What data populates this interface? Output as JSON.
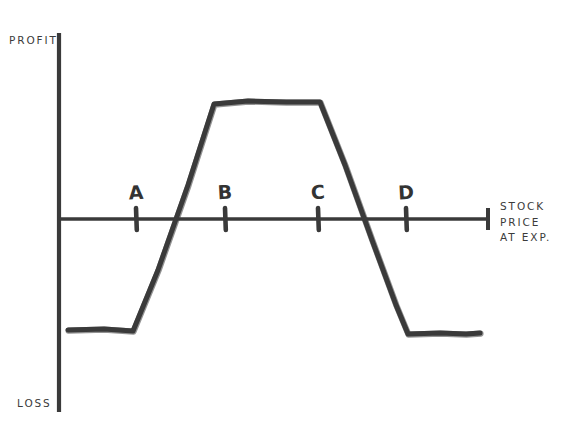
{
  "figure": {
    "kind": "options-payoff-diagram",
    "background_color": "#ffffff",
    "ink_color": "#3a3a3a",
    "text_color": "#3b3b3b"
  },
  "axes": {
    "y_axis": {
      "top_label": "PROFIT",
      "bottom_label": "LOSS",
      "x_pixel": 59,
      "y_top_pixel": 33,
      "y_bottom_pixel": 412
    },
    "x_axis": {
      "label_lines": [
        "STOCK",
        "PRICE",
        "AT EXP."
      ],
      "label_text": "STOCK PRICE AT EXP.",
      "y_pixel": 219,
      "x_start_pixel": 59,
      "x_end_pixel": 488,
      "has_end_cap": true
    }
  },
  "strikes": [
    {
      "id": "A",
      "label": "A",
      "tick_x": 136,
      "label_x": 124,
      "label_y": 183
    },
    {
      "id": "B",
      "label": "B",
      "tick_x": 225,
      "label_x": 213,
      "label_y": 183
    },
    {
      "id": "C",
      "label": "C",
      "tick_x": 318,
      "label_x": 306,
      "label_y": 183
    },
    {
      "id": "D",
      "label": "D",
      "tick_x": 406,
      "label_x": 394,
      "label_y": 183
    }
  ],
  "chart_data": {
    "type": "line",
    "title": "",
    "subtitle": "",
    "xlabel": "STOCK PRICE AT EXP.",
    "ylabel": "PROFIT / LOSS",
    "grid": false,
    "legend": null,
    "annotations": [
      "A",
      "B",
      "C",
      "D",
      "PROFIT",
      "LOSS",
      "STOCK PRICE AT EXP."
    ],
    "axis_tick_labels": {
      "x": [
        "A",
        "B",
        "C",
        "D"
      ],
      "y": [
        "PROFIT",
        "LOSS"
      ]
    },
    "xlim": [
      59,
      488
    ],
    "ylim": [
      412,
      33
    ],
    "zero_line_y": 219,
    "series": [
      {
        "name": "Payoff at expiration",
        "color": "#3a3a3a",
        "points_pixel": [
          [
            68,
            330
          ],
          [
            104,
            329
          ],
          [
            133,
            331
          ],
          [
            158,
            270
          ],
          [
            188,
            185
          ],
          [
            214,
            104
          ],
          [
            248,
            101
          ],
          [
            286,
            102
          ],
          [
            320,
            102
          ],
          [
            345,
            165
          ],
          [
            372,
            240
          ],
          [
            396,
            305
          ],
          [
            408,
            334
          ],
          [
            440,
            333
          ],
          [
            466,
            334
          ],
          [
            480,
            333
          ]
        ],
        "key_values": [
          {
            "region": "below A",
            "payoff": "max loss"
          },
          {
            "x_strike": "A",
            "payoff": "max loss (breakout begins)"
          },
          {
            "x_strike": "B",
            "payoff": "max profit reached"
          },
          {
            "region": "B to C",
            "payoff": "max profit (flat)"
          },
          {
            "x_strike": "C",
            "payoff": "max profit (decline begins)"
          },
          {
            "x_strike": "D",
            "payoff": "max loss reached"
          },
          {
            "region": "above D",
            "payoff": "max loss"
          }
        ]
      }
    ]
  }
}
